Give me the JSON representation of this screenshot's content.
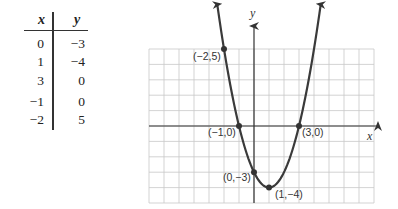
{
  "table": {
    "headers": [
      "x",
      "y"
    ],
    "rows": [
      {
        "x": "0",
        "y": "−3"
      },
      {
        "x": "1",
        "y": "−4"
      },
      {
        "x": "3",
        "y": "0"
      },
      {
        "x": "−1",
        "y": "0"
      },
      {
        "x": "−2",
        "y": "5"
      }
    ]
  },
  "chart_data": {
    "type": "line",
    "title": "",
    "function": "y = x^2 - 2x - 3",
    "xlabel": "x",
    "ylabel": "y",
    "xlim": [
      -7,
      8
    ],
    "ylim": [
      -5,
      5
    ],
    "grid": true,
    "x": [
      -2,
      -1,
      0,
      1,
      3
    ],
    "series": [
      {
        "name": "parabola",
        "points": [
          [
            -2,
            5
          ],
          [
            -1,
            0
          ],
          [
            0,
            -3
          ],
          [
            1,
            -4
          ],
          [
            3,
            0
          ]
        ]
      }
    ],
    "annotations": [
      {
        "label": "(−2,5)",
        "x": -2,
        "y": 5
      },
      {
        "label": "(−1,0)",
        "x": -1,
        "y": 0
      },
      {
        "label": "(0,−3)",
        "x": 0,
        "y": -3
      },
      {
        "label": "(1,−4)",
        "x": 1,
        "y": -4
      },
      {
        "label": "(3,0)",
        "x": 3,
        "y": 0
      }
    ],
    "colors": {
      "curve": "#3a3a3a",
      "grid": "#c8c8c8",
      "axis": "#333333"
    }
  }
}
